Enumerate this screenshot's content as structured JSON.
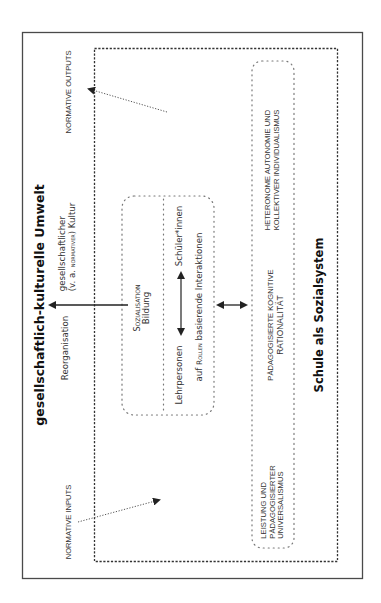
{
  "diagram": {
    "orientation": "rotated-90-ccw",
    "title": "gesellschaftlich-kulturelle Umwelt",
    "system_label": "Schule als Sozialsystem",
    "normative_outputs": "Normative Outputs",
    "normative_inputs": "Normative Inputs",
    "culture": {
      "line1": "gesellschaftlicher",
      "line2_prefix": "(v. a. ",
      "line2_smallcaps": "normativer",
      "line2_suffix": ") Kultur"
    },
    "reorganisation": "Reorganisation",
    "center_box": {
      "sozialisation": "Sozialisation",
      "bildung": "Bildung",
      "lehrpersonen": "Lehrpersonen",
      "schueler": "Schüler*innen",
      "interaction_prefix": "auf ",
      "interaction_smallcaps": "Rollen",
      "interaction_suffix": " basierende Interaktionen"
    },
    "value_box": {
      "left": {
        "line1": "Leistung und",
        "line2": "pädagogisierter",
        "line3": "Universalismus"
      },
      "middle": {
        "line1": "pädagogisierte kognitive",
        "line2": "Rationalität"
      },
      "right": {
        "line1": "heteronome Autonomie und",
        "line2": "kollektiver Individualismus"
      }
    },
    "colors": {
      "frame": "#444444",
      "dashed": "#333333",
      "dotted": "#777777",
      "arrow": "#222222",
      "text": "#222222"
    }
  }
}
